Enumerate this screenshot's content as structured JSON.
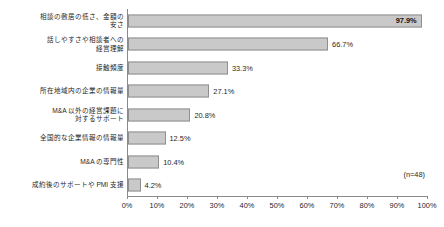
{
  "chart_data": {
    "type": "bar",
    "orientation": "horizontal",
    "title": "",
    "subtitle": "",
    "xlabel": "",
    "ylabel": "",
    "xlim": [
      0,
      100
    ],
    "grid": false,
    "legend": null,
    "annotation": "(n=48)",
    "tick_labels": [
      "0%",
      "10%",
      "20%",
      "30%",
      "40%",
      "50%",
      "60%",
      "70%",
      "80%",
      "90%",
      "100%"
    ],
    "tick_values": [
      0,
      10,
      20,
      30,
      40,
      50,
      60,
      70,
      80,
      90,
      100
    ],
    "bar_color": "#c9c9c9",
    "bar_border_color": "#8f8f8f",
    "axis_color": "#8a8a8a",
    "categories": [
      "相談の敷居の低さ、金額の\n安さ",
      "話しやすさや相談者への\n経営理解",
      "接触頻度",
      "所在地域内の企業の情報量",
      "M&A 以外の経営課題に\n対するサポート",
      "全国的な企業情報の情報量",
      "M&A の専門性",
      "成約後のサポートや PMI 支援"
    ],
    "values": [
      97.9,
      66.7,
      33.3,
      27.1,
      20.8,
      12.5,
      10.4,
      4.2
    ],
    "value_labels": [
      "97.9%",
      "66.7%",
      "33.3%",
      "27.1%",
      "20.8%",
      "12.5%",
      "10.4%",
      "4.2%"
    ],
    "label_inside": [
      true,
      false,
      false,
      false,
      false,
      false,
      false,
      false
    ]
  }
}
